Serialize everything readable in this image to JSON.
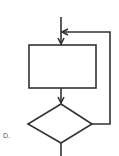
{
  "diagram": {
    "type": "flowchart-loop",
    "option_label": "D.",
    "nodes": [
      {
        "id": "process",
        "shape": "rectangle",
        "text": ""
      },
      {
        "id": "decision",
        "shape": "diamond",
        "text": ""
      }
    ],
    "edges": [
      {
        "from": "entry",
        "to": "process"
      },
      {
        "from": "process",
        "to": "decision"
      },
      {
        "from": "decision",
        "to": "process",
        "via": "right-loop"
      },
      {
        "from": "decision",
        "to": "exit"
      }
    ],
    "stroke_color": "#333333"
  }
}
